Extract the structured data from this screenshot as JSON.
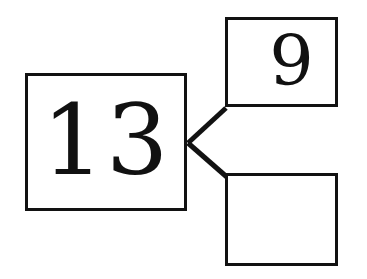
{
  "diagram": {
    "type": "number-bond",
    "title": "",
    "background_color": "#ffffff",
    "stroke_color": "#121212",
    "whole": {
      "label": "13",
      "role": "whole",
      "filled": true
    },
    "parts": [
      {
        "label": "9",
        "role": "part",
        "position": "top",
        "filled": true
      },
      {
        "label": "",
        "role": "part",
        "position": "bottom",
        "filled": false
      }
    ],
    "connectors": [
      {
        "name": "whole-to-top-part",
        "from": {
          "x": 188,
          "y": 143
        },
        "to": {
          "x": 226,
          "y": 108
        }
      },
      {
        "name": "whole-to-bottom-part",
        "from": {
          "x": 188,
          "y": 143
        },
        "to": {
          "x": 228,
          "y": 178
        }
      }
    ]
  }
}
